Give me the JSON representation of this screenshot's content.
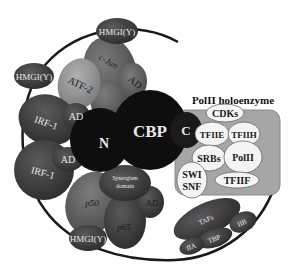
{
  "diagram": {
    "title": "PolII holoenzyme",
    "enhanceosome": {
      "hmgiy_top": "HMGI(Y)",
      "hmgiy_left": "HMGI(Y)",
      "hmgiy_bottom": "HMGI(Y)",
      "atf2": "ATF-2",
      "cjun": "c-Jun",
      "cjun_ad": "AD",
      "irf1_top": "IRF-1",
      "irf1_top_ad": "AD",
      "irf1_bottom": "IRF-1",
      "irf1_bottom_ad": "AD",
      "p50": "p50",
      "p65": "p65",
      "p65_ad": "AD",
      "synergism_line1": "Synergism",
      "synergism_line2": "domain"
    },
    "cbp": {
      "label": "CBP",
      "n_terminal": "N",
      "c_terminal": "C"
    },
    "holoenzyme": {
      "cdks": "CDKs",
      "tfiie": "TFIIE",
      "tfiih": "TFIIH",
      "srbs": "SRBs",
      "polii": "PolII",
      "swi": "SWI",
      "snf": "SNF",
      "tfiif": "TFIIF"
    },
    "tfiid": {
      "tafs": "TAFs",
      "tbp": "TBP",
      "iia": "IIA",
      "iib": "IIB"
    },
    "colors": {
      "dark_protein": "#3a3a3a",
      "mid_protein": "#6a6a6a",
      "light_protein": "#9a9a9a",
      "cbp": "#0e0e0e",
      "holoenzyme_box": "#a8a8a8",
      "white_subunit": "#f4f4f4",
      "dna": "#1a1a1a"
    }
  }
}
